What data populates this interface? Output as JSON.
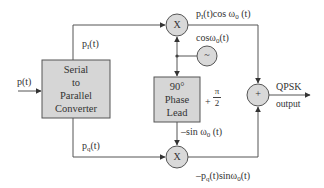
{
  "diagram": {
    "input": {
      "label": "p(t)"
    },
    "blocks": {
      "serial_to_parallel": {
        "lines": [
          "Serial",
          "to",
          "Parallel",
          "Converter"
        ]
      },
      "phase_lead": {
        "lines": [
          "90°",
          "Phase",
          "Lead"
        ],
        "annotation_sign": "+",
        "annotation_num": "π",
        "annotation_den": "2"
      },
      "oscillator": {
        "symbol": "~",
        "label": "cosω",
        "label_sub": "0",
        "label_tail": "(t)"
      },
      "multiplier_top": {
        "symbol": "X"
      },
      "multiplier_bottom": {
        "symbol": "X"
      },
      "summer": {
        "symbol": "+"
      }
    },
    "signals": {
      "in_phase": {
        "base": "p",
        "sub": "I",
        "tail": "(t)"
      },
      "quadrature": {
        "base": "p",
        "sub": "q",
        "tail": "(t)"
      },
      "top_product": {
        "pre": "p",
        "sub1": "I",
        "mid": "(t)cos ω",
        "sub2": "0",
        "tail": " (t)"
      },
      "neg_sin": {
        "pre": "–sin ω",
        "sub": "0",
        "tail": " (t)"
      },
      "bottom_product": {
        "pre": "–p",
        "sub1": "q",
        "mid": "(t)sinω",
        "sub2": "0",
        "tail": "(t)"
      }
    },
    "output": {
      "line1": "QPSK",
      "line2": "output"
    },
    "colors": {
      "box_fill": "#d6d6d6",
      "node_fill": "#d9d9d9",
      "stroke": "#555555"
    }
  }
}
